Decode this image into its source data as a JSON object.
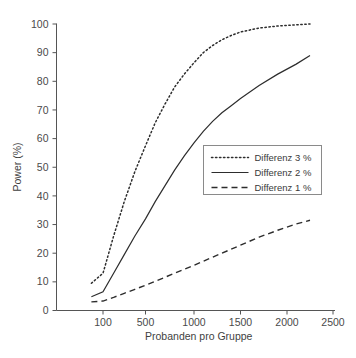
{
  "chart_data": {
    "type": "line",
    "title": "",
    "xlabel": "Probanden pro Gruppe",
    "ylabel": "Power (%)",
    "xlim": [
      0,
      2500
    ],
    "ylim": [
      0,
      100
    ],
    "grid": false,
    "legend_position": "center-right",
    "xticks": [
      100,
      500,
      1000,
      1500,
      2000,
      2500
    ],
    "xtick_labels": [
      "100",
      "500",
      "1000",
      "1500",
      "2000",
      "2500"
    ],
    "yticks": [
      0,
      10,
      20,
      30,
      40,
      50,
      60,
      70,
      80,
      90,
      100
    ],
    "ytick_labels": [
      "0",
      "10",
      "20",
      "30",
      "40",
      "50",
      "60",
      "70",
      "80",
      "90",
      "100"
    ],
    "series": [
      {
        "name": "Differenz 3 %",
        "style": "dotted",
        "color": "#2d2d2d",
        "x": [
          75,
          100,
          200,
          300,
          400,
          500,
          600,
          700,
          800,
          900,
          1000,
          1100,
          1200,
          1300,
          1400,
          1500,
          1700,
          1900,
          2100,
          2250
        ],
        "y": [
          9.5,
          13.0,
          26.0,
          38.0,
          48.5,
          57.5,
          65.5,
          72.0,
          78.0,
          82.5,
          86.5,
          90.0,
          92.5,
          94.5,
          96.0,
          97.2,
          98.6,
          99.3,
          99.7,
          100.0
        ]
      },
      {
        "name": "Differenz 2 %",
        "style": "solid",
        "color": "#2d2d2d",
        "x": [
          75,
          100,
          200,
          300,
          400,
          500,
          600,
          700,
          800,
          900,
          1000,
          1100,
          1200,
          1300,
          1400,
          1500,
          1700,
          1900,
          2100,
          2250
        ],
        "y": [
          4.8,
          6.5,
          13.0,
          19.5,
          26.0,
          32.0,
          38.0,
          43.5,
          49.0,
          54.0,
          58.5,
          62.5,
          66.0,
          69.0,
          71.5,
          74.0,
          78.5,
          82.5,
          86.0,
          89.0
        ]
      },
      {
        "name": "Differenz 1 %",
        "style": "dashed",
        "color": "#2d2d2d",
        "x": [
          75,
          100,
          200,
          300,
          400,
          500,
          600,
          700,
          800,
          900,
          1000,
          1100,
          1200,
          1300,
          1400,
          1500,
          1700,
          1900,
          2100,
          2250
        ],
        "y": [
          3.0,
          3.3,
          4.6,
          6.0,
          7.4,
          8.8,
          10.2,
          11.6,
          13.0,
          14.4,
          15.8,
          17.2,
          18.6,
          20.0,
          21.4,
          22.8,
          25.6,
          28.0,
          30.2,
          31.5
        ]
      }
    ]
  },
  "legend": {
    "entries": [
      {
        "label": "Differenz 3 %",
        "style": "dotted"
      },
      {
        "label": "Differenz 2 %",
        "style": "solid"
      },
      {
        "label": "Differenz 1 %",
        "style": "dashed"
      }
    ]
  },
  "colors": {
    "background": "#ffffff",
    "axis": "#555555",
    "line": "#2d2d2d",
    "text": "#3a3a3a",
    "legend_border": "#8a8a8a"
  }
}
